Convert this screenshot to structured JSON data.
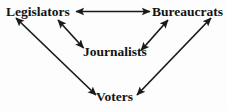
{
  "diagram": {
    "type": "node-link-diagram",
    "background_color": "#fdfdfd",
    "stroke_color": "#1a1a1a",
    "text_color": "#141414",
    "nodes": [
      {
        "id": "legislators",
        "label": "Legislators",
        "x": 40,
        "y": 12
      },
      {
        "id": "bureaucrats",
        "label": "Bureaucrats",
        "x": 188,
        "y": 12
      },
      {
        "id": "journalists",
        "label": "Journalists",
        "x": 112,
        "y": 52
      },
      {
        "id": "voters",
        "label": "Voters",
        "x": 116,
        "y": 97
      }
    ],
    "edges": [
      {
        "id": "edge-legislators-bureaucrats",
        "from": "legislators",
        "to": "bureaucrats",
        "direction": "bidirectional",
        "style": "solid"
      },
      {
        "id": "edge-legislators-journalists",
        "from": "legislators",
        "to": "journalists",
        "direction": "bidirectional",
        "style": "solid"
      },
      {
        "id": "edge-journalists-bureaucrats",
        "from": "journalists",
        "to": "bureaucrats",
        "direction": "bidirectional",
        "style": "solid"
      },
      {
        "id": "edge-legislators-voters",
        "from": "legislators",
        "to": "voters",
        "direction": "bidirectional",
        "style": "solid"
      },
      {
        "id": "edge-bureaucrats-voters",
        "from": "bureaucrats",
        "to": "voters",
        "direction": "bidirectional",
        "style": "solid"
      }
    ]
  }
}
